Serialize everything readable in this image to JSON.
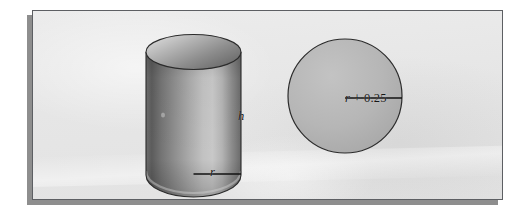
{
  "figure": {
    "kind": "geometry-figure",
    "background_color": "#e7e7e7",
    "frame_border_color": "#5d5f63",
    "shadow_color": "#8e8e8e",
    "page_background": "#ffffff"
  },
  "cylinder": {
    "name": "cylinder",
    "height_label": {
      "variable": "h",
      "text": "h"
    },
    "radius_label": {
      "variable": "r",
      "text": "r"
    },
    "body_color_dark": "#5f5f5f",
    "body_color_light": "#c4c4c4",
    "top_face_color": "#9a9a9a",
    "outline_color": "#2e2e2e"
  },
  "circle": {
    "name": "circle",
    "radius_label": {
      "variable": "r",
      "operator": "+",
      "value": "0.25",
      "text": "r + 0.25"
    },
    "fill_color": "#b4b4b4",
    "outline_color": "#2e2e2e"
  }
}
